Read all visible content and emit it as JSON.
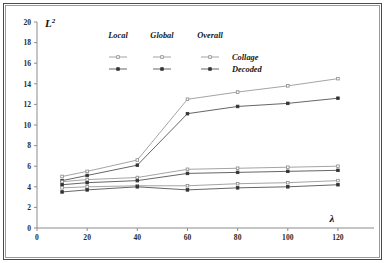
{
  "figure": {
    "background": "#ffffff",
    "frame_color": "#4a4a4a"
  },
  "axes": {
    "y_title": "L",
    "y_title_sup": "2",
    "x_title": "λ",
    "x_ticks": [
      "0",
      "20",
      "40",
      "60",
      "80",
      "100",
      "120"
    ],
    "y_ticks": [
      "0",
      "2",
      "4",
      "6",
      "8",
      "10",
      "12",
      "14",
      "16",
      "18",
      "20"
    ]
  },
  "legend": {
    "columns": [
      {
        "label": "Local"
      },
      {
        "label": "Global"
      },
      {
        "label": "Overall"
      }
    ],
    "rows": [
      {
        "label": "Collage"
      },
      {
        "label": "Decoded"
      }
    ]
  },
  "chart_data": {
    "type": "line",
    "title": "",
    "xlabel": "λ",
    "ylabel": "L2",
    "xlim": [
      0,
      128
    ],
    "ylim": [
      0,
      20
    ],
    "x": [
      10,
      20,
      40,
      60,
      80,
      100,
      120
    ],
    "xtick_values": [
      0,
      20,
      40,
      60,
      80,
      100,
      120
    ],
    "ytick_values": [
      0,
      2,
      4,
      6,
      8,
      10,
      12,
      14,
      16,
      18,
      20
    ],
    "grid": false,
    "legend_position": "top-center",
    "series": [
      {
        "name": "Overall Collage",
        "group": "Overall",
        "variant": "Collage",
        "color": "#9a9a9a",
        "marker": "dot-open",
        "values": [
          5.0,
          5.5,
          6.6,
          12.5,
          13.2,
          13.8,
          14.5
        ]
      },
      {
        "name": "Overall Decoded",
        "group": "Overall",
        "variant": "Decoded",
        "color": "#555555",
        "marker": "dot-filled",
        "values": [
          4.6,
          5.1,
          6.1,
          11.1,
          11.8,
          12.1,
          12.6
        ]
      },
      {
        "name": "Global Collage",
        "group": "Global",
        "variant": "Collage",
        "color": "#9a9a9a",
        "marker": "dot-open",
        "values": [
          4.5,
          4.7,
          4.9,
          5.7,
          5.8,
          5.9,
          6.0
        ]
      },
      {
        "name": "Global Decoded",
        "group": "Global",
        "variant": "Decoded",
        "color": "#555555",
        "marker": "dot-filled",
        "values": [
          4.2,
          4.4,
          4.6,
          5.3,
          5.4,
          5.5,
          5.6
        ]
      },
      {
        "name": "Local Collage",
        "group": "Local",
        "variant": "Collage",
        "color": "#9a9a9a",
        "marker": "dot-open",
        "values": [
          3.9,
          4.0,
          4.1,
          4.1,
          4.3,
          4.4,
          4.6
        ]
      },
      {
        "name": "Local Decoded",
        "group": "Local",
        "variant": "Decoded",
        "color": "#555555",
        "marker": "dot-filled",
        "values": [
          3.5,
          3.7,
          4.0,
          3.7,
          3.9,
          4.0,
          4.2
        ]
      }
    ]
  }
}
